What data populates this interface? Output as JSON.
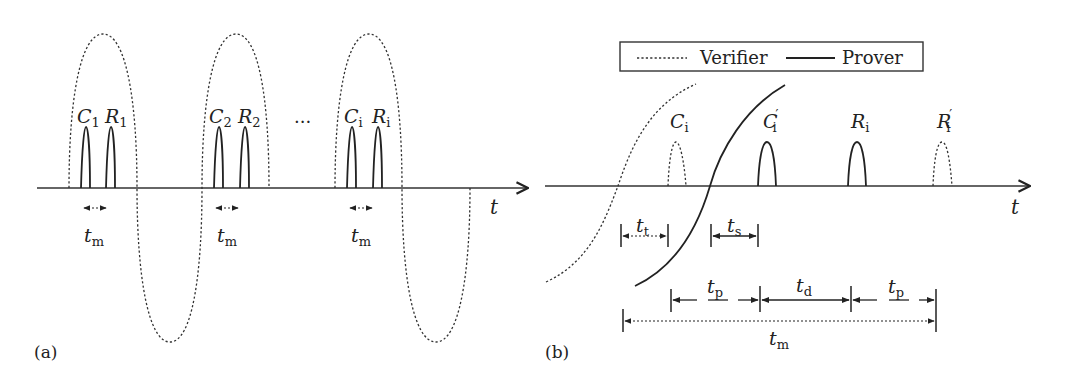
{
  "panel_a": {
    "label": "(a)",
    "axis_label": "t",
    "ellipsis": "...",
    "pulses": [
      {
        "c_label": "C",
        "c_sub": "1",
        "r_label": "R",
        "r_sub": "1",
        "interval_label": "t",
        "interval_sub": "m"
      },
      {
        "c_label": "C",
        "c_sub": "2",
        "r_label": "R",
        "r_sub": "2",
        "interval_label": "t",
        "interval_sub": "m"
      },
      {
        "c_label": "C",
        "c_sub": "i",
        "r_label": "R",
        "r_sub": "i",
        "interval_label": "t",
        "interval_sub": "m"
      }
    ]
  },
  "panel_b": {
    "label": "(b)",
    "axis_label": "t",
    "legend": {
      "verifier": "Verifier",
      "prover": "Prover"
    },
    "signals": [
      {
        "label": "C",
        "sub": "i",
        "prime": "",
        "style": "dotted"
      },
      {
        "label": "C",
        "sub": "i",
        "prime": "′",
        "style": "solid"
      },
      {
        "label": "R",
        "sub": "i",
        "prime": "",
        "style": "solid"
      },
      {
        "label": "R",
        "sub": "i",
        "prime": "′",
        "style": "dotted"
      }
    ],
    "intervals": {
      "tt": {
        "label": "t",
        "sub": "t"
      },
      "ts": {
        "label": "t",
        "sub": "s"
      },
      "tp1": {
        "label": "t",
        "sub": "p"
      },
      "td": {
        "label": "t",
        "sub": "d"
      },
      "tp2": {
        "label": "t",
        "sub": "p"
      },
      "tm": {
        "label": "t",
        "sub": "m"
      }
    }
  },
  "colors": {
    "line": "#222222",
    "background": "#ffffff"
  }
}
